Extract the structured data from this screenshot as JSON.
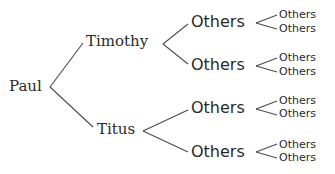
{
  "diagram": {
    "type": "tree",
    "root": "Paul",
    "level1": [
      {
        "label": "Timothy"
      },
      {
        "label": "Titus"
      }
    ],
    "level2": [
      {
        "label": "Others",
        "parent": "Timothy"
      },
      {
        "label": "Others",
        "parent": "Timothy"
      },
      {
        "label": "Others",
        "parent": "Titus"
      },
      {
        "label": "Others",
        "parent": "Titus"
      }
    ],
    "level3": [
      {
        "label": "Others"
      },
      {
        "label": "Others"
      },
      {
        "label": "Others"
      },
      {
        "label": "Others"
      },
      {
        "label": "Others"
      },
      {
        "label": "Others"
      },
      {
        "label": "Others"
      },
      {
        "label": "Others"
      }
    ],
    "line_color": "#4a4a4a",
    "text_color": "#2a2a2a"
  }
}
